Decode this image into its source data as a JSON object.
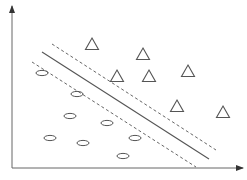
{
  "diagram": {
    "type": "svm-margin-illustration",
    "colors": {
      "stroke": "#555555",
      "axis": "#666666",
      "background": "#ffffff"
    },
    "axes": {
      "origin": [
        12,
        168
      ],
      "y_axis_top": [
        12,
        6
      ],
      "x_axis_right": [
        243,
        168
      ]
    },
    "hyperplane": {
      "from": [
        42,
        52
      ],
      "to": [
        209,
        159
      ]
    },
    "margin_upper": {
      "from": [
        52,
        44
      ],
      "to": [
        216,
        150
      ]
    },
    "margin_lower": {
      "from": [
        32,
        62
      ],
      "to": [
        196,
        167
      ]
    },
    "class_triangles": [
      {
        "x": 92,
        "y": 44
      },
      {
        "x": 143,
        "y": 54
      },
      {
        "x": 117,
        "y": 76
      },
      {
        "x": 149,
        "y": 76
      },
      {
        "x": 188,
        "y": 71
      },
      {
        "x": 177,
        "y": 106
      },
      {
        "x": 223,
        "y": 112
      }
    ],
    "class_ellipses": [
      {
        "x": 42,
        "y": 73
      },
      {
        "x": 77,
        "y": 94
      },
      {
        "x": 70,
        "y": 116
      },
      {
        "x": 107,
        "y": 123
      },
      {
        "x": 50,
        "y": 138
      },
      {
        "x": 83,
        "y": 143
      },
      {
        "x": 135,
        "y": 138
      },
      {
        "x": 123,
        "y": 156
      }
    ]
  }
}
